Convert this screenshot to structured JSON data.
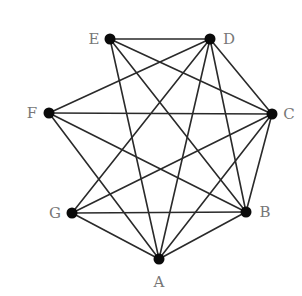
{
  "diagram": {
    "type": "graph",
    "nodes": [
      {
        "id": "A",
        "label": "A",
        "x": 159,
        "y": 259,
        "lx": 159,
        "ly": 282
      },
      {
        "id": "B",
        "label": "B",
        "x": 246,
        "y": 212,
        "lx": 265,
        "ly": 212
      },
      {
        "id": "C",
        "label": "C",
        "x": 272,
        "y": 114,
        "lx": 289,
        "ly": 114
      },
      {
        "id": "D",
        "label": "D",
        "x": 210,
        "y": 39,
        "lx": 229,
        "ly": 39
      },
      {
        "id": "E",
        "label": "E",
        "x": 110,
        "y": 39,
        "lx": 94,
        "ly": 39
      },
      {
        "id": "F",
        "label": "F",
        "x": 49,
        "y": 113,
        "lx": 32,
        "ly": 113
      },
      {
        "id": "G",
        "label": "G",
        "x": 72,
        "y": 213,
        "lx": 55,
        "ly": 213
      }
    ],
    "edges": [
      [
        "E",
        "D"
      ],
      [
        "E",
        "A"
      ],
      [
        "E",
        "B"
      ],
      [
        "E",
        "C"
      ],
      [
        "D",
        "F"
      ],
      [
        "D",
        "G"
      ],
      [
        "D",
        "A"
      ],
      [
        "D",
        "B"
      ],
      [
        "D",
        "C"
      ],
      [
        "F",
        "C"
      ],
      [
        "F",
        "A"
      ],
      [
        "F",
        "B"
      ],
      [
        "C",
        "G"
      ],
      [
        "C",
        "A"
      ],
      [
        "C",
        "B"
      ],
      [
        "G",
        "B"
      ],
      [
        "G",
        "A"
      ],
      [
        "B",
        "A"
      ]
    ],
    "colors": {
      "edge": "#2a2a2a",
      "node": "#0a0a0a",
      "label": "#777777",
      "background": "#ffffff"
    }
  }
}
